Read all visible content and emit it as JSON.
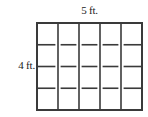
{
  "figure": {
    "title_text": "",
    "shape": "rectangle-grid",
    "background_color": "#ffffff",
    "line_color": "#3a3a3a"
  },
  "labels": {
    "top": "5 ft.",
    "left": "4 ft."
  },
  "chart_data": {
    "type": "diagram",
    "diagram_kind": "area-model-unit-square-grid",
    "title": "",
    "width_label": "5 ft.",
    "height_label": "4 ft.",
    "width_units": 5,
    "height_units": 4,
    "total_unit_squares": 20,
    "unit": "ft.",
    "columns": 5,
    "rows": 4,
    "interior_line_style": "broken-at-intersections",
    "outer_border": true,
    "grid": true,
    "legend": null,
    "annotations": []
  },
  "geometry": {
    "outer": {
      "x": 37,
      "y": 23,
      "width": 105,
      "height": 87
    },
    "stroke_outer": 2,
    "stroke_inner": 1.6,
    "gap": 2.6
  }
}
